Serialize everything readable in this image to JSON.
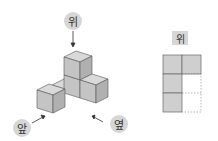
{
  "diagram": {
    "labels": {
      "top": "위",
      "front": "앞",
      "side": "옆"
    },
    "answer_view": {
      "title": "위",
      "grid": {
        "rows": 3,
        "cols": 2,
        "filled": [
          [
            1,
            1
          ],
          [
            1,
            2
          ],
          [
            2,
            1
          ],
          [
            3,
            1
          ]
        ]
      }
    },
    "colors": {
      "cube_top": "#d9d9d9",
      "cube_left": "#c4c4c4",
      "cube_right": "#b0b0b0",
      "grid_fill": "#cfcfcf",
      "label_bg": "#d6d6d6"
    }
  }
}
